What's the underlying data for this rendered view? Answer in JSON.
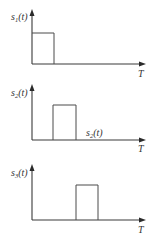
{
  "diagram": {
    "title": "",
    "panels": [
      {
        "y_label": "s",
        "y_label_sub": "1",
        "y_label_arg": "(t)",
        "x_label": "T",
        "pulse": {
          "start_frac": 0.0,
          "end_frac": 0.2,
          "height": 1
        }
      },
      {
        "y_label": "s",
        "y_label_sub": "2",
        "y_label_arg": "(t)",
        "x_label": "T",
        "annotation": {
          "text": "s",
          "sub": "2",
          "arg": "(t)"
        },
        "pulse": {
          "start_frac": 0.2,
          "end_frac": 0.4,
          "height": 1
        }
      },
      {
        "y_label": "s",
        "y_label_sub": "3",
        "y_label_arg": "(t)",
        "x_label": "T",
        "pulse": {
          "start_frac": 0.4,
          "end_frac": 0.6,
          "height": 1
        }
      }
    ]
  },
  "colors": {
    "line": "#3a3a3a",
    "text": "#333333",
    "background": "#ffffff"
  }
}
